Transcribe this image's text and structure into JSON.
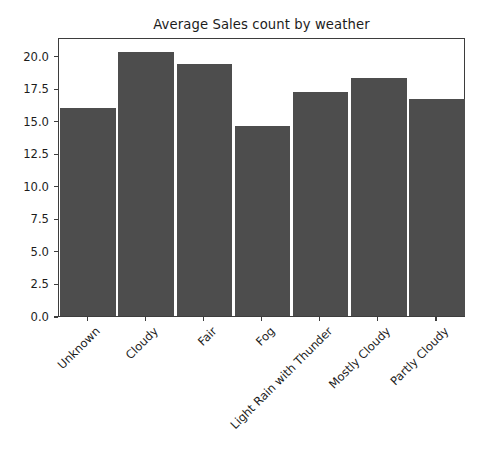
{
  "chart_data": {
    "type": "bar",
    "title": "Average Sales count by weather",
    "xlabel": "",
    "ylabel": "",
    "categories": [
      "Unknown",
      "Cloudy",
      "Fair",
      "Fog",
      "Light Rain with Thunder",
      "Mostly Cloudy",
      "Partly Cloudy"
    ],
    "values": [
      16.0,
      20.3,
      19.4,
      14.6,
      17.2,
      18.3,
      16.7
    ],
    "ylim": [
      0.0,
      21.45
    ],
    "yticks": [
      0.0,
      2.5,
      5.0,
      7.5,
      10.0,
      12.5,
      15.0,
      17.5,
      20.0
    ],
    "ytick_labels": [
      "0.0",
      "2.5",
      "5.0",
      "7.5",
      "10.0",
      "12.5",
      "15.0",
      "17.5",
      "20.0"
    ],
    "grid": false,
    "legend": null,
    "bar_color": "#4d4d4d",
    "axes_color": "#3d3d3d",
    "background_color": "#ffffff",
    "xtick_rotation": -45
  }
}
